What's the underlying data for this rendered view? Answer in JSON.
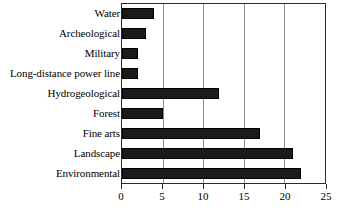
{
  "chart_data": {
    "type": "bar",
    "orientation": "horizontal",
    "title": "",
    "xlabel": "",
    "ylabel": "",
    "categories": [
      "Water",
      "Archeological",
      "Military",
      "Long-distance power line",
      "Hydrogeological",
      "Forest",
      "Fine arts",
      "Landscape",
      "Environmental"
    ],
    "values": [
      4,
      3,
      2,
      2,
      12,
      5,
      17,
      21,
      22
    ],
    "xlim": [
      0,
      25
    ],
    "xticks": [
      0,
      5,
      10,
      15,
      20,
      25
    ],
    "xtick_labels": [
      "0",
      "5",
      "10",
      "15",
      "20",
      "25"
    ],
    "grid": true,
    "grid_axis": "x",
    "legend": false,
    "bar_color": "#1a1a1a",
    "frame_color": "#2b2b2b",
    "gridline_color": "#8e8e8e",
    "background_color": "#ffffff"
  }
}
